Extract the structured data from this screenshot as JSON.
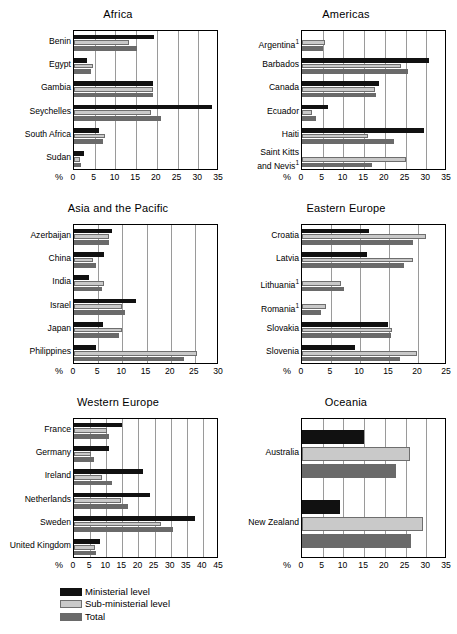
{
  "legend": {
    "position": "bottom-left",
    "items": [
      {
        "label": "Ministerial level",
        "color": "#111111",
        "key": "ministerial"
      },
      {
        "label": "Sub-ministerial level",
        "color": "#c9c9c9",
        "key": "sub_ministerial"
      },
      {
        "label": "Total",
        "color": "#6a6a6a",
        "key": "total"
      }
    ]
  },
  "axis_unit_symbol": "%",
  "footnote_marker": "1",
  "chart_data": [
    {
      "id": "africa",
      "type": "bar",
      "orientation": "horizontal",
      "title": "Africa",
      "xlabel": "%",
      "ylabel": "",
      "xlim": [
        0,
        35
      ],
      "xticks": [
        0,
        5,
        10,
        15,
        20,
        25,
        30,
        35
      ],
      "grid": true,
      "categories": [
        "Benin",
        "Egypt",
        "Gambia",
        "Seychelles",
        "South Africa",
        "Sudan"
      ],
      "category_notes": [
        "",
        "",
        "",
        "",
        "",
        ""
      ],
      "series": [
        {
          "name": "Ministerial level",
          "values": [
            19.2,
            3.1,
            19.0,
            33.3,
            6.1,
            2.3
          ]
        },
        {
          "name": "Sub-ministerial level",
          "values": [
            13.3,
            4.7,
            19.1,
            18.7,
            7.5,
            1.4
          ]
        },
        {
          "name": "Total",
          "values": [
            15.1,
            4.0,
            19.1,
            21.0,
            6.9,
            1.7
          ]
        }
      ]
    },
    {
      "id": "americas",
      "type": "bar",
      "orientation": "horizontal",
      "title": "Americas",
      "xlabel": "%",
      "ylabel": "",
      "xlim": [
        0,
        35
      ],
      "xticks": [
        0,
        5,
        10,
        15,
        20,
        25,
        30,
        35
      ],
      "grid": true,
      "categories": [
        "Argentina",
        "Barbados",
        "Canada",
        "Ecuador",
        "Haiti",
        "Saint Kitts and Nevis"
      ],
      "category_notes": [
        "1",
        "",
        "",
        "",
        "",
        "1"
      ],
      "series": [
        {
          "name": "Ministerial level",
          "values": [
            0.0,
            30.7,
            18.5,
            6.2,
            29.4,
            0.0
          ]
        },
        {
          "name": "Sub-ministerial level",
          "values": [
            5.6,
            23.8,
            17.6,
            2.3,
            15.9,
            25.0
          ]
        },
        {
          "name": "Total",
          "values": [
            5.1,
            25.5,
            17.8,
            3.4,
            22.2,
            16.8
          ]
        }
      ]
    },
    {
      "id": "asia-and-the-pacific",
      "type": "bar",
      "orientation": "horizontal",
      "title": "Asia and the Pacific",
      "xlabel": "%",
      "ylabel": "",
      "xlim": [
        0,
        30
      ],
      "xticks": [
        0,
        5,
        10,
        15,
        20,
        25,
        30
      ],
      "grid": true,
      "categories": [
        "Azerbaijan",
        "China",
        "India",
        "Israel",
        "Japan",
        "Philippines"
      ],
      "category_notes": [
        "",
        "",
        "",
        "",
        "",
        ""
      ],
      "series": [
        {
          "name": "Ministerial level",
          "values": [
            7.9,
            6.2,
            3.1,
            12.9,
            6.0,
            4.5
          ]
        },
        {
          "name": "Sub-ministerial level",
          "values": [
            7.2,
            3.9,
            6.3,
            9.9,
            10.0,
            25.4
          ]
        },
        {
          "name": "Total",
          "values": [
            7.3,
            4.5,
            5.8,
            10.6,
            9.4,
            22.8
          ]
        }
      ]
    },
    {
      "id": "eastern-europe",
      "type": "bar",
      "orientation": "horizontal",
      "title": "Eastern Europe",
      "xlabel": "%",
      "ylabel": "",
      "xlim": [
        0,
        25
      ],
      "xticks": [
        0,
        5,
        10,
        15,
        20,
        25
      ],
      "grid": true,
      "categories": [
        "Croatia",
        "Latvia",
        "Lithuania",
        "Romania",
        "Slovakia",
        "Slovenia"
      ],
      "category_notes": [
        "",
        "",
        "1",
        "1",
        "",
        ""
      ],
      "series": [
        {
          "name": "Ministerial level",
          "values": [
            11.5,
            11.2,
            0.0,
            0.0,
            14.9,
            9.2
          ]
        },
        {
          "name": "Sub-ministerial level",
          "values": [
            21.3,
            19.1,
            6.8,
            4.1,
            15.6,
            19.9
          ]
        },
        {
          "name": "Total",
          "values": [
            19.2,
            17.6,
            7.3,
            3.3,
            15.4,
            16.9
          ]
        }
      ]
    },
    {
      "id": "western-europe",
      "type": "bar",
      "orientation": "horizontal",
      "title": "Western Europe",
      "xlabel": "%",
      "ylabel": "",
      "xlim": [
        0,
        45
      ],
      "xticks": [
        0,
        5,
        10,
        15,
        20,
        25,
        30,
        35,
        40,
        45
      ],
      "grid": true,
      "categories": [
        "France",
        "Germany",
        "Ireland",
        "Netherlands",
        "Sweden",
        "United Kingdom"
      ],
      "category_notes": [
        "",
        "",
        "",
        "",
        "",
        ""
      ],
      "series": [
        {
          "name": "Ministerial level",
          "values": [
            14.8,
            10.9,
            21.4,
            23.5,
            37.7,
            8.1
          ]
        },
        {
          "name": "Sub-ministerial level",
          "values": [
            10.2,
            5.3,
            8.7,
            14.6,
            27.0,
            6.5
          ]
        },
        {
          "name": "Total",
          "values": [
            11.0,
            6.3,
            11.7,
            16.7,
            30.6,
            6.9
          ]
        }
      ]
    },
    {
      "id": "oceania",
      "type": "bar",
      "orientation": "horizontal",
      "title": "Oceania",
      "xlabel": "%",
      "ylabel": "",
      "xlim": [
        0,
        35
      ],
      "xticks": [
        0,
        5,
        10,
        15,
        20,
        25,
        30,
        35
      ],
      "grid": true,
      "categories": [
        "Australia",
        "New Zealand"
      ],
      "category_notes": [
        "",
        ""
      ],
      "series": [
        {
          "name": "Ministerial level",
          "values": [
            14.9,
            9.1
          ]
        },
        {
          "name": "Sub-ministerial level",
          "values": [
            26.1,
            29.1
          ]
        },
        {
          "name": "Total",
          "values": [
            22.8,
            26.3
          ]
        }
      ]
    }
  ]
}
